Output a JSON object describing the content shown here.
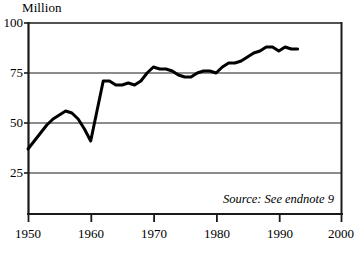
{
  "figure": {
    "unit_label": "Million",
    "source_note": "Source: See endnote 9"
  },
  "chart_data": {
    "type": "line",
    "title": "",
    "subtitle": "",
    "xlabel": "",
    "ylabel": "Million",
    "xlim": [
      1950,
      2000
    ],
    "ylim": [
      0,
      100
    ],
    "xticks": [
      1950,
      1960,
      1970,
      1980,
      1990,
      2000
    ],
    "xtick_labels": [
      "1950",
      "1960",
      "1970",
      "1980",
      "1990",
      "2000"
    ],
    "yticks": [
      25,
      50,
      75,
      100
    ],
    "ytick_labels": [
      "25",
      "50",
      "75",
      "100"
    ],
    "grid": "horizontal",
    "legend": "none",
    "annotations": [
      "Source: See endnote 9"
    ],
    "line_color": "#000000",
    "line_width_px": 3,
    "series": [
      {
        "name": "Million",
        "x": [
          1950,
          1951,
          1952,
          1953,
          1954,
          1955,
          1956,
          1957,
          1958,
          1959,
          1960,
          1961,
          1962,
          1963,
          1964,
          1965,
          1966,
          1967,
          1968,
          1969,
          1970,
          1971,
          1972,
          1973,
          1974,
          1975,
          1976,
          1977,
          1978,
          1979,
          1980,
          1981,
          1982,
          1983,
          1984,
          1985,
          1986,
          1987,
          1988,
          1989,
          1990,
          1991,
          1992,
          1993
        ],
        "values": [
          37,
          41,
          45,
          49,
          52,
          54,
          56,
          55,
          52,
          47,
          41,
          56,
          71,
          71,
          69,
          69,
          70,
          69,
          71,
          75,
          78,
          77,
          77,
          76,
          74,
          73,
          73,
          75,
          76,
          76,
          75,
          78,
          80,
          80,
          81,
          83,
          85,
          86,
          88,
          88,
          86,
          88,
          87,
          87
        ]
      }
    ]
  }
}
